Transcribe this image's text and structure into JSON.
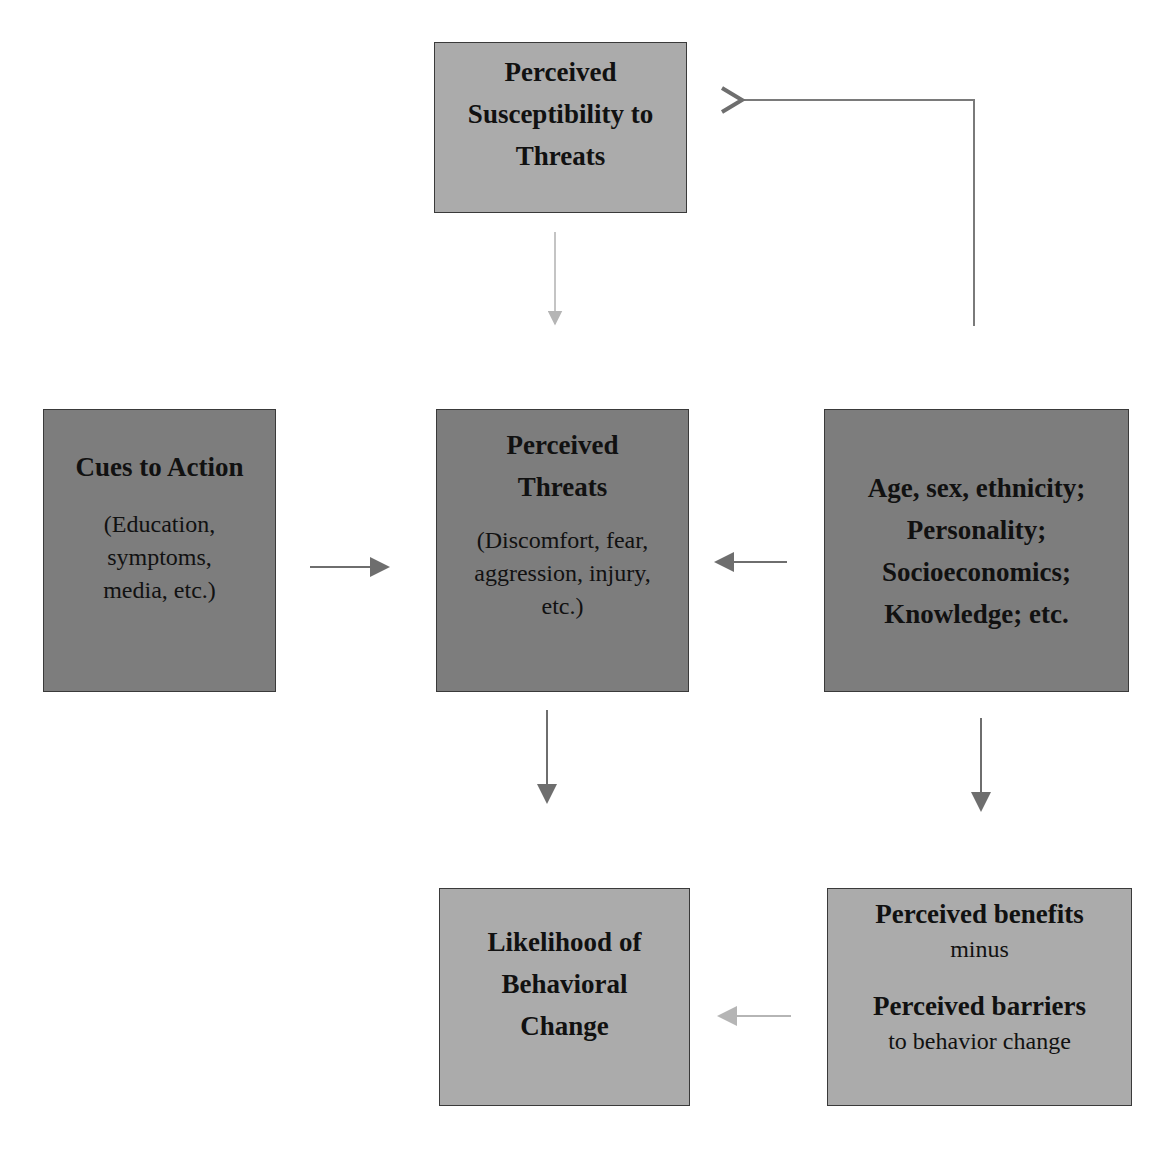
{
  "diagram": {
    "nodes": {
      "susceptibility": {
        "title_lines": [
          "Perceived",
          "Susceptibility to",
          "Threats"
        ]
      },
      "cues": {
        "title": "Cues to Action",
        "detail_lines": [
          "(Education,",
          "symptoms,",
          "media, etc.)"
        ]
      },
      "threats": {
        "title_lines": [
          "Perceived",
          "Threats"
        ],
        "detail_lines": [
          "(Discomfort, fear,",
          "aggression, injury,",
          "etc.)"
        ]
      },
      "modifying": {
        "title_lines": [
          "Age, sex, ethnicity;",
          "Personality;",
          "Socioeconomics;",
          "Knowledge; etc."
        ]
      },
      "likelihood": {
        "title_lines": [
          "Likelihood of",
          "Behavioral",
          "Change"
        ]
      },
      "benefits": {
        "benefits": "Perceived benefits",
        "minus": "minus",
        "barriers": "Perceived barriers",
        "barriers_sub": "to behavior change"
      }
    },
    "edges": [
      {
        "from": "modifying",
        "to": "susceptibility"
      },
      {
        "from": "susceptibility",
        "to": "threats"
      },
      {
        "from": "cues",
        "to": "threats"
      },
      {
        "from": "modifying",
        "to": "threats"
      },
      {
        "from": "threats",
        "to": "likelihood"
      },
      {
        "from": "modifying",
        "to": "benefits"
      },
      {
        "from": "benefits",
        "to": "likelihood"
      }
    ],
    "colors": {
      "light_box": "#ababab",
      "dark_box": "#7d7d7d",
      "arrow_dark": "#6e6e6e",
      "arrow_light": "#b0b0b0"
    }
  }
}
